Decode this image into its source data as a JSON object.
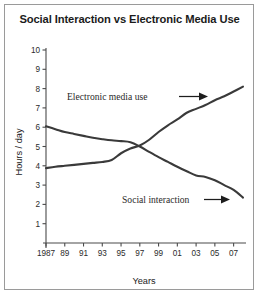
{
  "chart_data": {
    "type": "line",
    "title": "Social Interaction vs Electronic Media Use",
    "xlabel": "Years",
    "ylabel": "Hours / day",
    "grid": false,
    "legend": "inline-annotations",
    "xlim": [
      1987,
      2008
    ],
    "ylim": [
      0,
      10
    ],
    "x_tick_labels": [
      "1987",
      "89",
      "91",
      "93",
      "95",
      "97",
      "99",
      "01",
      "03",
      "05",
      "07"
    ],
    "x_tick_values": [
      1987,
      1989,
      1991,
      1993,
      1995,
      1997,
      1999,
      2001,
      2003,
      2005,
      2007
    ],
    "y_tick_labels": [
      "1",
      "2",
      "3",
      "4",
      "5",
      "6",
      "7",
      "8",
      "9",
      "10"
    ],
    "y_tick_values": [
      1,
      2,
      3,
      4,
      5,
      6,
      7,
      8,
      9,
      10
    ],
    "x": [
      1987,
      1988,
      1989,
      1990,
      1991,
      1992,
      1993,
      1994,
      1995,
      1996,
      1997,
      1998,
      1999,
      2000,
      2001,
      2002,
      2003,
      2004,
      2005,
      2006,
      2007,
      2008
    ],
    "series": [
      {
        "name": "Social interaction",
        "color": "#3a3a3a",
        "values": [
          6.05,
          5.9,
          5.75,
          5.65,
          5.55,
          5.45,
          5.38,
          5.32,
          5.28,
          5.22,
          5.0,
          4.72,
          4.45,
          4.2,
          3.95,
          3.72,
          3.5,
          3.42,
          3.25,
          3.0,
          2.75,
          2.35
        ]
      },
      {
        "name": "Electronic media use",
        "color": "#3a3a3a",
        "values": [
          3.88,
          3.95,
          4.0,
          4.05,
          4.1,
          4.15,
          4.2,
          4.3,
          4.65,
          4.9,
          5.05,
          5.35,
          5.75,
          6.1,
          6.4,
          6.75,
          6.95,
          7.15,
          7.4,
          7.6,
          7.85,
          8.1
        ]
      }
    ],
    "annotations": [
      {
        "text": "Electronic media use",
        "arrow": "right-arrow",
        "points_to_series": "Electronic media use"
      },
      {
        "text": "Social interaction",
        "arrow": "right-arrow",
        "points_to_series": "Social interaction"
      }
    ]
  },
  "colors": {
    "background": "#ffffff",
    "frame": "#9a9a9a",
    "axis": "#4a4a4a",
    "line": "#3a3a3a",
    "text": "#1b1b1b"
  }
}
